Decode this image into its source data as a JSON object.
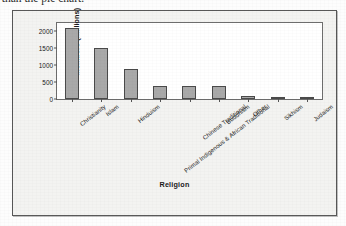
{
  "caption": {
    "text": "ve than the pie chart."
  },
  "figure": {
    "background_color": "#f3f3f1",
    "border_color": "#585858"
  },
  "chart_data": {
    "type": "bar",
    "title": "",
    "xlabel": "Religion",
    "ylabel": "Members (millions)",
    "categories": [
      "Christianity",
      "Islam",
      "Hinduism",
      "Primal Indigenous & African Traditional",
      "Chinese Traditional",
      "Buddhism",
      "Other",
      "Sikhism",
      "Judaism"
    ],
    "values": [
      2100,
      1500,
      900,
      400,
      394,
      376,
      100,
      23,
      14
    ],
    "ylim": [
      0,
      2250
    ],
    "yticks": [
      0,
      500,
      1000,
      1500,
      2000
    ],
    "ytick_labels": [
      "0",
      "500",
      "1000",
      "1500",
      "2000"
    ],
    "grid": false,
    "legend": false,
    "bar_color": "#a9a9a9",
    "bar_edge_color": "#4a4a4a",
    "plot_background": "#ffffff"
  }
}
